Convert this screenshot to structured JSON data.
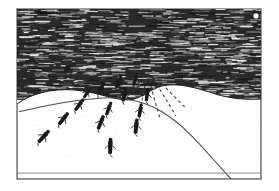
{
  "artwork": {
    "title": "Skiers descending a snow slope at night",
    "medium": "scratchboard engraving",
    "caption": "",
    "frame": {
      "x": 16,
      "y": 8,
      "width": 246,
      "height": 172,
      "border_color": "#9a9a9a",
      "border_width": 1
    },
    "canvas": {
      "width": 279,
      "height": 191,
      "background": "#ffffff"
    }
  },
  "palette": {
    "paper_white": "#ffffff",
    "snow_white": "#fdfdfd",
    "sky_dark": "#2a2a2a",
    "hatch_light": "#f2f2f2",
    "ink_black": "#161616",
    "line_gray": "#5a5a5a",
    "frame_gray": "#9a9a9a"
  },
  "sky": {
    "name": "night-sky",
    "fill": "#2a2a2a",
    "hatch_style": "horizontal-streak",
    "hatch_color": "#f2f2f2",
    "hatch_line_count": 150,
    "region_top": 0,
    "region_bottom": 92
  },
  "sun": {
    "name": "moon",
    "cx": 241,
    "cy": 7,
    "r": 2.6,
    "fill": "#f6f6f6",
    "visible": true
  },
  "horizon": {
    "name": "snow-horizon",
    "description": "undulating snow hills meeting the dark sky",
    "path": "M 0 96 C 14 86, 34 80, 58 82 C 82 84, 96 92, 112 92 C 124 92, 132 82, 146 78 C 162 74, 182 80, 200 86 C 216 91, 232 92, 246 91 L 246 172 L 0 172 Z",
    "fill": "#ffffff",
    "stroke": "#1b1b1b",
    "stroke_width": 1
  },
  "ridge": {
    "name": "ridge-line",
    "description": "long curving ridge descending to the lower right",
    "path": "M 2 104 C 26 98, 56 92, 86 90 C 110 89, 128 93, 146 104 C 166 116, 182 134, 196 150 C 206 161, 212 168, 216 172",
    "stroke": "#4a4a4a",
    "stroke_width": 1.1
  },
  "baseline": {
    "name": "snow-baseline",
    "y": 166,
    "stroke": "#7a7a7a",
    "stroke_width": 0.9
  },
  "figures": {
    "name": "skier-figures",
    "count": 14,
    "fill": "#1a1a1a",
    "description": "small elongated human figures seen from above descending the slope",
    "items": [
      {
        "id": "f1",
        "cx": 102,
        "cy": 75,
        "len": 11,
        "w": 4.0,
        "angle": 24
      },
      {
        "id": "f2",
        "cx": 119,
        "cy": 72,
        "len": 10,
        "w": 3.8,
        "angle": 18
      },
      {
        "id": "f3",
        "cx": 84,
        "cy": 82,
        "len": 11,
        "w": 4.0,
        "angle": 28
      },
      {
        "id": "f4",
        "cx": 70,
        "cy": 86,
        "len": 10,
        "w": 3.6,
        "angle": 34
      },
      {
        "id": "f5",
        "cx": 108,
        "cy": 88,
        "len": 12,
        "w": 4.2,
        "angle": 14
      },
      {
        "id": "f6",
        "cx": 131,
        "cy": 88,
        "len": 11,
        "w": 4.0,
        "angle": 8
      },
      {
        "id": "f7",
        "cx": 62,
        "cy": 98,
        "len": 12,
        "w": 4.2,
        "angle": 36
      },
      {
        "id": "f8",
        "cx": 92,
        "cy": 102,
        "len": 12,
        "w": 4.2,
        "angle": 20
      },
      {
        "id": "f9",
        "cx": 124,
        "cy": 104,
        "len": 12,
        "w": 4.2,
        "angle": 10
      },
      {
        "id": "f10",
        "cx": 46,
        "cy": 112,
        "len": 13,
        "w": 4.4,
        "angle": 38
      },
      {
        "id": "f11",
        "cx": 84,
        "cy": 116,
        "len": 13,
        "w": 4.4,
        "angle": 22
      },
      {
        "id": "f12",
        "cx": 120,
        "cy": 120,
        "len": 13,
        "w": 4.6,
        "angle": 6
      },
      {
        "id": "f13",
        "cx": 26,
        "cy": 130,
        "len": 14,
        "w": 4.6,
        "angle": 42
      },
      {
        "id": "f14",
        "cx": 94,
        "cy": 140,
        "len": 14,
        "w": 4.8,
        "angle": 2
      }
    ]
  },
  "tracks": {
    "name": "ski-track-dashes",
    "stroke": "#3a3a3a",
    "stroke_width": 1.1,
    "dash_pattern": "3 3",
    "description": "dashed tracks fanning out downslope from the crest",
    "paths": [
      "M 130 72 C 128 82, 126 92, 124 104",
      "M 134 72 C 136 84, 140 96, 144 110",
      "M 138 71 C 144 82, 152 94, 160 108",
      "M 142 71 C 150 80, 160 90, 170 100",
      "M 127 73 C 121 80, 114 86, 106 92",
      "M 124 74 C 116 79, 106 83, 96 86"
    ]
  }
}
